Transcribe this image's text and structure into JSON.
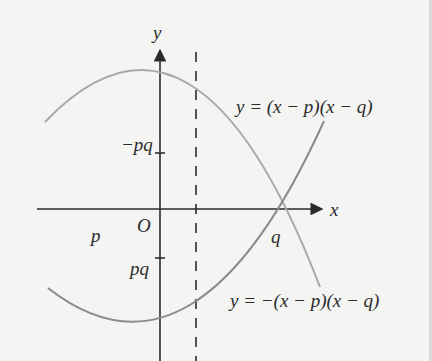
{
  "diagram": {
    "type": "function-graph",
    "axes": {
      "x_label": "x",
      "y_label": "y",
      "origin_label": "O"
    },
    "points": {
      "p_label": "p",
      "q_label": "q",
      "y_intercept_top_label": "−pq",
      "y_intercept_bottom_label": "pq"
    },
    "curves": [
      {
        "name": "upward-parabola",
        "equation": "y = (x − p)(x − q)",
        "opens": "up",
        "color": "#8a8a8a"
      },
      {
        "name": "downward-parabola",
        "equation": "y = −(x − p)(x − q)",
        "opens": "down",
        "color": "#a8a8a8"
      }
    ],
    "symmetry_line": {
      "style": "dashed",
      "position": "x = (p + q)/2"
    },
    "colors": {
      "background": "#f4f4f3",
      "axis": "#2b2b2b",
      "curve_up": "#8a8a8a",
      "curve_down": "#a8a8a8",
      "text": "#2b2b2b"
    }
  }
}
